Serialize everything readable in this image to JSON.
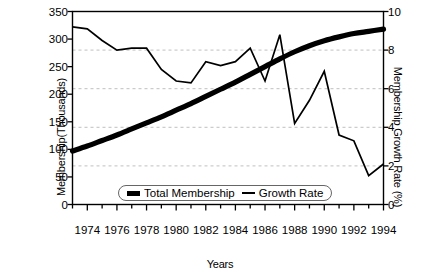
{
  "chart_data": {
    "type": "line",
    "title": "",
    "xlabel": "Years",
    "ylabel": "Membership(Thousands)",
    "ylabel_right": "Membership Growth Rate (%)",
    "xlim": [
      1973,
      1994
    ],
    "ylim": [
      0,
      350
    ],
    "ylim_right": [
      0,
      10
    ],
    "xticks": [
      1974,
      1976,
      1978,
      1980,
      1982,
      1984,
      1986,
      1988,
      1990,
      1992,
      1994
    ],
    "xtick_labels": [
      "1974",
      "1976",
      "1978",
      "1980",
      "1982",
      "1984",
      "1986",
      "1988",
      "1990",
      "1992",
      "1994"
    ],
    "yticks_left": [
      0,
      50,
      100,
      150,
      200,
      250,
      300,
      350
    ],
    "ytick_labels_left": [
      "0",
      "50",
      "100",
      "150",
      "200",
      "250",
      "300",
      "350"
    ],
    "yticks_right": [
      0,
      2,
      4,
      6,
      8,
      10
    ],
    "ytick_labels_right": [
      "0",
      "2",
      "4",
      "6",
      "8",
      "10"
    ],
    "minor_xticks_every": 1,
    "grid": true,
    "grid_axis": "y-right",
    "grid_style": "dashed",
    "legend_position": "lower center",
    "x": [
      1973,
      1974,
      1975,
      1976,
      1977,
      1978,
      1979,
      1980,
      1981,
      1982,
      1983,
      1984,
      1985,
      1986,
      1987,
      1988,
      1989,
      1990,
      1991,
      1992,
      1993,
      1994
    ],
    "series": [
      {
        "name": "Total Membership",
        "axis": "left",
        "unit": "thousands",
        "line_width": "thick",
        "color": "#000000",
        "values": [
          97,
          106,
          116,
          126,
          137,
          148,
          159,
          171,
          183,
          196,
          209,
          222,
          236,
          250,
          264,
          277,
          288,
          297,
          304,
          310,
          314,
          318
        ]
      },
      {
        "name": "Growth Rate",
        "axis": "right",
        "unit": "percent",
        "line_width": "thin",
        "color": "#000000",
        "values": [
          9.2,
          9.1,
          8.5,
          8.0,
          8.1,
          8.1,
          7.0,
          6.4,
          6.3,
          7.4,
          7.2,
          7.4,
          8.1,
          6.4,
          8.8,
          4.2,
          5.4,
          6.9,
          3.6,
          3.3,
          1.5,
          2.1
        ]
      }
    ],
    "legend": [
      {
        "label": "Total Membership",
        "marker": "thick-bar"
      },
      {
        "label": "Growth Rate",
        "marker": "thin-line"
      }
    ]
  }
}
